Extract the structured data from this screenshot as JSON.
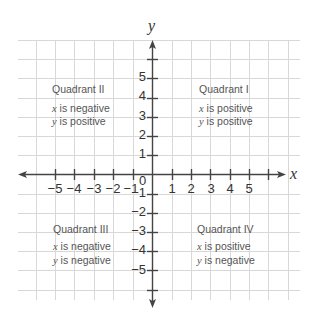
{
  "axes": {
    "x_label": "x",
    "y_label": "y",
    "origin_label": "0",
    "x_ticks": [
      "−5",
      "−4",
      "−3",
      "−2",
      "−1",
      "1",
      "2",
      "3",
      "4",
      "5"
    ],
    "y_ticks_pos": [
      "5",
      "4",
      "3",
      "2",
      "1"
    ],
    "y_ticks_neg": [
      "−1",
      "−2",
      "−3",
      "−4",
      "−5"
    ]
  },
  "quadrants": {
    "q1": {
      "title": "Quadrant I",
      "line1_var": "x",
      "line1_text": " is positive",
      "line2_var": "y",
      "line2_text": " is positive"
    },
    "q2": {
      "title": "Quadrant II",
      "line1_var": "x",
      "line1_text": " is negative",
      "line2_var": "y",
      "line2_text": " is positive"
    },
    "q3": {
      "title": "Quadrant III",
      "line1_var": "x",
      "line1_text": " is negative",
      "line2_var": "y",
      "line2_text": " is negative"
    },
    "q4": {
      "title": "Quadrant IV",
      "line1_var": "x",
      "line1_text": " is positive",
      "line2_var": "y",
      "line2_text": " is negative"
    }
  },
  "colors": {
    "grid": "#d8d8d8",
    "axis": "#444444",
    "text": "#555555"
  }
}
